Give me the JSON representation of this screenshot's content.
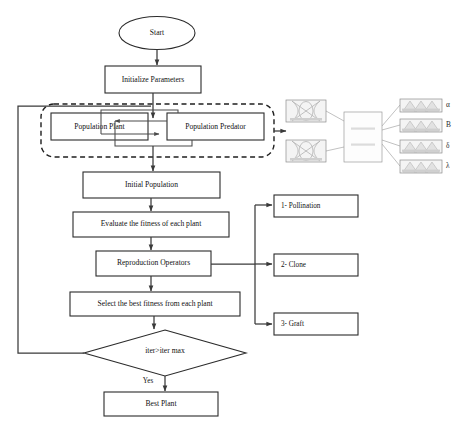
{
  "diagram": {
    "type": "flowchart",
    "background_color": "#ffffff",
    "line_color": "#3a3a3a",
    "nodes": {
      "start": "Start",
      "initialize": "Initialize Parameters",
      "population_plant": "Population Plant",
      "population_predator": "Population Predator",
      "initial_population": "Initial Population",
      "evaluate": "Evaluate the fitness of each plant",
      "reproduction": "Reproduction Operators",
      "select_best": "Select the best fitness from each plant",
      "decision": "iter>iter max",
      "best_plant": "Best Plant"
    },
    "operators": [
      {
        "id": "op-pollination",
        "label": "1- Pollination"
      },
      {
        "id": "op-clone",
        "label": "2- Clone"
      },
      {
        "id": "op-graft",
        "label": "3- Graft"
      }
    ],
    "edge_labels": {
      "decision_yes": "Yes"
    },
    "inset": {
      "name": "crossover-offspring-illustration",
      "parents": [
        {
          "id": "parent-1",
          "caption": ""
        },
        {
          "id": "parent-2",
          "caption": ""
        }
      ],
      "middle": {
        "id": "recombination-unit",
        "line_1": "",
        "line_2": ""
      },
      "offspring": [
        {
          "id": "offspring-alpha",
          "label": "α"
        },
        {
          "id": "offspring-beta",
          "label": "B"
        },
        {
          "id": "offspring-delta",
          "label": "δ"
        },
        {
          "id": "offspring-lambda",
          "label": "λ"
        }
      ]
    }
  }
}
